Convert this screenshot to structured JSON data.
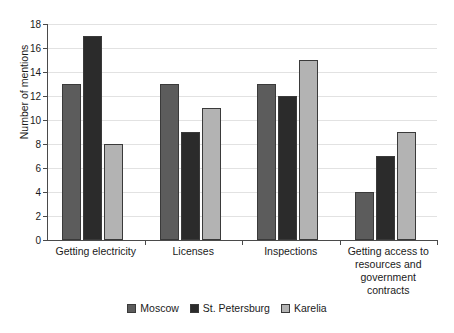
{
  "chart_data": {
    "type": "bar",
    "title": "",
    "xlabel": "",
    "ylabel": "Number of mentions",
    "ylim": [
      0,
      18
    ],
    "ytick_step": 2,
    "yticks": [
      "0",
      "2",
      "4",
      "6",
      "8",
      "10",
      "12",
      "14",
      "16",
      "18"
    ],
    "grid": true,
    "legend_position": "bottom",
    "categories": [
      "Getting electricity",
      "Licenses",
      "Inspections",
      "Getting access to\nresources and\ngovernment\ncontracts"
    ],
    "series": [
      {
        "name": "Moscow",
        "color": "#5c5c5c",
        "values": [
          13,
          13,
          13,
          4
        ]
      },
      {
        "name": "St. Petersburg",
        "color": "#2b2b2b",
        "values": [
          17,
          9,
          12,
          7
        ]
      },
      {
        "name": "Karelia",
        "color": "#b3b3b3",
        "values": [
          8,
          11,
          15,
          9
        ]
      }
    ]
  },
  "axis": {
    "axis_color": "#4a4a4a",
    "grid_color": "#e2e2e2",
    "bar_border_color": "#3a3a3a"
  }
}
